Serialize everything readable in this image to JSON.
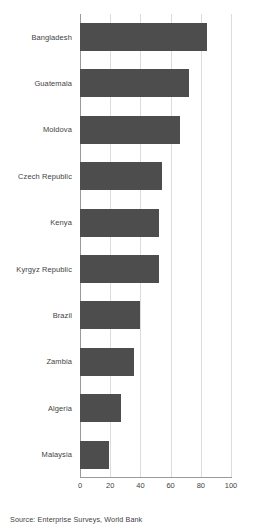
{
  "chart_data": {
    "type": "bar",
    "orientation": "horizontal",
    "title": "",
    "xlabel": "",
    "ylabel": "",
    "xlim": [
      0,
      100
    ],
    "xticks": [
      0,
      20,
      40,
      60,
      80,
      100
    ],
    "grid": true,
    "legend": null,
    "categories": [
      "Bangladesh",
      "Guatemala",
      "Moldova",
      "Czech Republic",
      "Kenya",
      "Kyrgyz Republic",
      "Brazil",
      "Zambia",
      "Algeria",
      "Malaysia"
    ],
    "values": [
      84,
      72,
      66,
      54,
      52,
      52,
      40,
      36,
      27,
      19
    ],
    "bar_color": "#4d4d4d",
    "gridline_color": "#dcdcdc",
    "axis_color": "#9a9a9a"
  },
  "source": {
    "text": "Source: Enterprise Surveys, World Bank"
  }
}
